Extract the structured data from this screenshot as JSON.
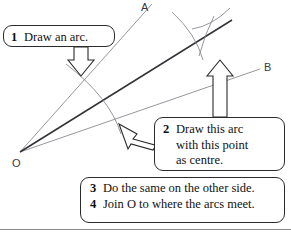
{
  "figure": {
    "background_color": "#ffffff"
  },
  "geometry": {
    "vertex_label": "O",
    "ray_labels": {
      "upper": "A",
      "lower": "B"
    },
    "colors": {
      "ray": "#8a8a92",
      "bisector": "#333338",
      "arc": "#8a8a92",
      "callout_border": "#2b2b2b",
      "text": "#111111",
      "rule": "#8c8c8c"
    },
    "points": {
      "O": [
        20,
        152
      ],
      "A_end": [
        150,
        6
      ],
      "B_end": [
        258,
        68
      ],
      "arc_intersection": [
        200,
        37
      ]
    }
  },
  "callouts": [
    {
      "id": "callout-1",
      "number": "1",
      "lines": [
        "Draw an arc."
      ],
      "arrow": "down-arrow"
    },
    {
      "id": "callout-2",
      "number": "2",
      "lines": [
        "Draw this arc",
        "with this point",
        "as centre."
      ],
      "arrow": "up-arrow"
    },
    {
      "id": "callout-3-4",
      "items": [
        {
          "number": "3",
          "text": "Do the same on the other side."
        },
        {
          "number": "4",
          "text": "Join O to where the arcs meet."
        }
      ]
    }
  ]
}
